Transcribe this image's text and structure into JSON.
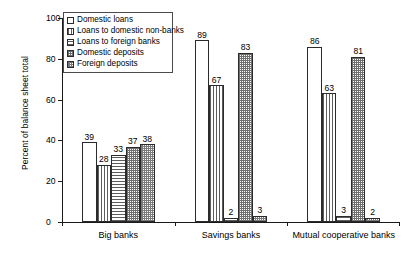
{
  "chart_data": {
    "type": "bar",
    "title": "",
    "xlabel": "",
    "ylabel": "Percent of balance sheet total",
    "ylim": [
      0,
      100
    ],
    "yticks": [
      0,
      20,
      40,
      60,
      80,
      100
    ],
    "ytick_labels": [
      "0",
      "20",
      "40",
      "60",
      "80",
      "100"
    ],
    "grid": false,
    "legend_position": "top-left",
    "categories": [
      "Big banks",
      "Savings banks",
      "Mutual cooperative banks"
    ],
    "series": [
      {
        "name": "Domestic loans",
        "pattern": "empty",
        "values": [
          39,
          89,
          86
        ]
      },
      {
        "name": "Loans to domestic non-banks",
        "pattern": "vertical",
        "values": [
          28,
          67,
          63
        ]
      },
      {
        "name": "Loans to foreign banks",
        "pattern": "horizontal",
        "values": [
          33,
          2,
          3
        ]
      },
      {
        "name": "Domestic deposits",
        "pattern": "cross-dense",
        "values": [
          37,
          83,
          81
        ]
      },
      {
        "name": "Foreign deposits",
        "pattern": "cross-light",
        "values": [
          38,
          3,
          2
        ]
      }
    ]
  },
  "legend": {
    "items": [
      {
        "label": "Domestic loans"
      },
      {
        "label": "Loans to domestic non-banks"
      },
      {
        "label": "Loans to foreign banks"
      },
      {
        "label": "Domestic deposits"
      },
      {
        "label": "Foreign deposits"
      }
    ]
  }
}
